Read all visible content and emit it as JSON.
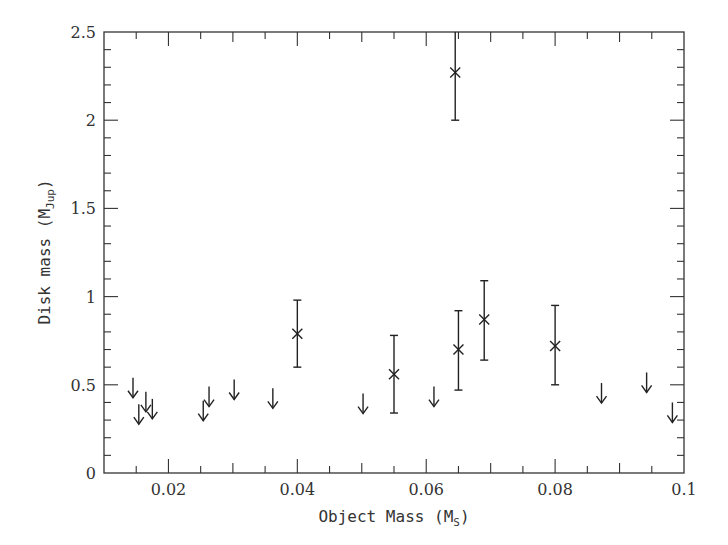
{
  "chart_data": {
    "type": "scatter",
    "title": "",
    "xlabel": "Object Mass (M_S)",
    "xlabel_main": "Object Mass (M",
    "xlabel_sub": "S",
    "xlabel_close": ")",
    "ylabel": "Disk mass (M_Jup)",
    "ylabel_main": "Disk mass (M",
    "ylabel_sub": "Jup",
    "ylabel_close": ")",
    "xlim": [
      0.01,
      0.1
    ],
    "ylim": [
      0,
      2.5
    ],
    "grid": false,
    "legend": null,
    "x_ticks": [
      {
        "value": 0.02,
        "label": "0.02"
      },
      {
        "value": 0.04,
        "label": "0.04"
      },
      {
        "value": 0.06,
        "label": "0.06"
      },
      {
        "value": 0.08,
        "label": "0.08"
      },
      {
        "value": 0.1,
        "label": "0.1"
      }
    ],
    "y_ticks": [
      {
        "value": 0,
        "label": "0"
      },
      {
        "value": 0.5,
        "label": "0.5"
      },
      {
        "value": 1,
        "label": "1"
      },
      {
        "value": 1.5,
        "label": "1.5"
      },
      {
        "value": 2,
        "label": "2"
      },
      {
        "value": 2.5,
        "label": "2.5"
      }
    ],
    "x_minor_step": 0.005,
    "x_major_tick_step": 0.01,
    "y_minor_step": 0.1,
    "series": [
      {
        "name": "detections",
        "marker": "x",
        "points": [
          {
            "x": 0.04,
            "y": 0.79,
            "yerr_low": 0.6,
            "yerr_high": 0.98
          },
          {
            "x": 0.055,
            "y": 0.56,
            "yerr_low": 0.34,
            "yerr_high": 0.78
          },
          {
            "x": 0.0645,
            "y": 2.27,
            "yerr_low": 2.0,
            "yerr_high": 2.54
          },
          {
            "x": 0.065,
            "y": 0.7,
            "yerr_low": 0.47,
            "yerr_high": 0.92
          },
          {
            "x": 0.069,
            "y": 0.87,
            "yerr_low": 0.64,
            "yerr_high": 1.09
          },
          {
            "x": 0.08,
            "y": 0.72,
            "yerr_low": 0.5,
            "yerr_high": 0.95
          }
        ]
      },
      {
        "name": "upper limits",
        "marker": "down-arrow",
        "points": [
          {
            "x": 0.0145,
            "y": 0.54
          },
          {
            "x": 0.0154,
            "y": 0.39
          },
          {
            "x": 0.0165,
            "y": 0.46
          },
          {
            "x": 0.0175,
            "y": 0.42
          },
          {
            "x": 0.0254,
            "y": 0.41
          },
          {
            "x": 0.0263,
            "y": 0.49
          },
          {
            "x": 0.0302,
            "y": 0.53
          },
          {
            "x": 0.0362,
            "y": 0.48
          },
          {
            "x": 0.0502,
            "y": 0.45
          },
          {
            "x": 0.0612,
            "y": 0.49
          },
          {
            "x": 0.0872,
            "y": 0.51
          },
          {
            "x": 0.0942,
            "y": 0.57
          },
          {
            "x": 0.0982,
            "y": 0.4
          }
        ]
      }
    ]
  },
  "style": {
    "axis_color": "#333333",
    "marker_color": "#222222",
    "background": "#ffffff"
  }
}
